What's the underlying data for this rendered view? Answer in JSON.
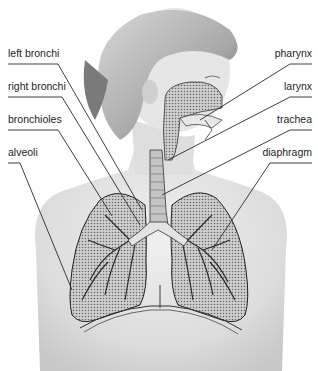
{
  "diagram": {
    "labels_left": [
      {
        "id": "left-bronchi",
        "text": "left bronchi",
        "x": 8,
        "y": 47
      },
      {
        "id": "right-bronchi",
        "text": "right bronchi",
        "x": 8,
        "y": 80
      },
      {
        "id": "bronchioles",
        "text": "bronchioles",
        "x": 8,
        "y": 113
      },
      {
        "id": "alveoli",
        "text": "alveoli",
        "x": 8,
        "y": 146
      }
    ],
    "labels_right": [
      {
        "id": "pharynx",
        "text": "pharynx",
        "x": 312,
        "y": 47
      },
      {
        "id": "larynx",
        "text": "larynx",
        "x": 312,
        "y": 80
      },
      {
        "id": "trachea",
        "text": "trachea",
        "x": 312,
        "y": 113
      },
      {
        "id": "diaphragm",
        "text": "diaphragm",
        "x": 312,
        "y": 146
      }
    ],
    "colors": {
      "line": "#2a2a2a",
      "skin": "#d9d9d9",
      "hair": "#bdbdbd",
      "lung": "#9a9a9a",
      "airway": "#e6e6e6"
    }
  }
}
